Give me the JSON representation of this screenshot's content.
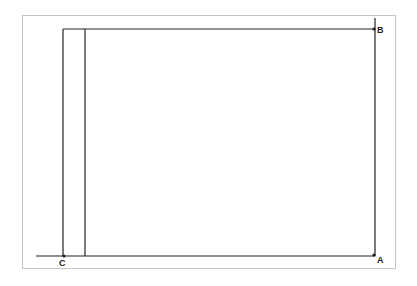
{
  "diagram": {
    "title": "",
    "type": "geometric-construction",
    "points": [
      {
        "id": "A",
        "label": "A",
        "x": 375,
        "y": 256
      },
      {
        "id": "B",
        "label": "B",
        "x": 375,
        "y": 29
      },
      {
        "id": "C",
        "label": "C",
        "x": 63,
        "y": 256
      }
    ],
    "lines": [
      {
        "name": "ground-line",
        "x1": 36,
        "y1": 256,
        "x2": 375,
        "y2": 256
      },
      {
        "name": "top-line",
        "x1": 63,
        "y1": 29,
        "x2": 375,
        "y2": 29
      },
      {
        "name": "left-vertical",
        "x1": 63,
        "y1": 29,
        "x2": 63,
        "y2": 256
      },
      {
        "name": "inner-vertical",
        "x1": 85,
        "y1": 29,
        "x2": 85,
        "y2": 256
      },
      {
        "name": "right-vertical",
        "x1": 375,
        "y1": 18,
        "x2": 375,
        "y2": 256
      }
    ],
    "colors": {
      "line": "#222222",
      "frame": "#c4c4c4",
      "background": "#ffffff"
    }
  }
}
